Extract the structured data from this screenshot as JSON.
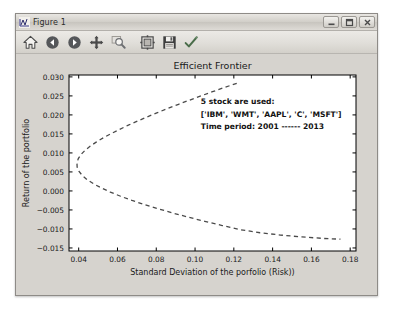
{
  "window": {
    "title": "Figure 1",
    "icon": "matplotlib-icon",
    "buttons": [
      {
        "name": "minimize-button",
        "glyph": "minimize"
      },
      {
        "name": "maximize-button",
        "glyph": "maximize"
      },
      {
        "name": "close-button",
        "glyph": "close"
      }
    ]
  },
  "toolbar": {
    "items": [
      {
        "name": "home-button",
        "icon": "home-icon",
        "tooltip": "Reset original view"
      },
      {
        "name": "back-button",
        "icon": "back-arrow-icon",
        "tooltip": "Back to previous view"
      },
      {
        "name": "forward-button",
        "icon": "forward-arrow-icon",
        "tooltip": "Forward to next view"
      },
      {
        "name": "pan-button",
        "icon": "pan-move-icon",
        "tooltip": "Pan axes with left mouse, zoom with right"
      },
      {
        "name": "zoom-button",
        "icon": "zoom-rect-icon",
        "tooltip": "Zoom to rectangle"
      },
      {
        "name": "configure-subplots-button",
        "icon": "subplot-config-icon",
        "tooltip": "Configure subplots"
      },
      {
        "name": "save-button",
        "icon": "floppy-save-icon",
        "tooltip": "Save the figure"
      },
      {
        "name": "edit-parameters-button",
        "icon": "edit-check-icon",
        "tooltip": "Edit axis, curve and image parameters"
      }
    ]
  },
  "chart_data": {
    "type": "line",
    "title": "Efficient Frontier",
    "xlabel": "Standard Deviation of the porfolio (Risk))",
    "ylabel": "Return of the portfolio",
    "xlim": [
      0.035,
      0.183
    ],
    "ylim": [
      -0.0158,
      0.0305
    ],
    "xticks": [
      "0.04",
      "0.06",
      "0.08",
      "0.10",
      "0.12",
      "0.14",
      "0.16",
      "0.18"
    ],
    "xtick_values": [
      0.04,
      0.06,
      0.08,
      0.1,
      0.12,
      0.14,
      0.16,
      0.18
    ],
    "yticks": [
      "0.030",
      "0.025",
      "0.020",
      "0.015",
      "0.010",
      "0.005",
      "0.000",
      "-0.005",
      "-0.010",
      "-0.015"
    ],
    "ytick_values": [
      0.03,
      0.025,
      0.02,
      0.015,
      0.01,
      0.005,
      0.0,
      -0.005,
      -0.01,
      -0.015
    ],
    "grid": false,
    "legend": "none",
    "line_style": "dashed",
    "line_color": "#4a4a4a",
    "series": [
      {
        "name": "efficient-frontier-curve",
        "comment": "sideways parabola; vertex at minimum-variance point",
        "x": [
          0.1215,
          0.115,
          0.109,
          0.103,
          0.0972,
          0.0915,
          0.086,
          0.0806,
          0.0754,
          0.0704,
          0.0656,
          0.0611,
          0.0568,
          0.0528,
          0.0492,
          0.046,
          0.0433,
          0.0412,
          0.0398,
          0.0391,
          0.0392,
          0.0401,
          0.0418,
          0.0443,
          0.0476,
          0.0516,
          0.0563,
          0.0616,
          0.0675,
          0.074,
          0.081,
          0.0885,
          0.0965,
          0.105,
          0.114,
          0.1235,
          0.1335,
          0.144,
          0.155,
          0.1663,
          0.175
        ],
        "y": [
          0.0283,
          0.0272,
          0.0261,
          0.025,
          0.0239,
          0.0228,
          0.0217,
          0.0206,
          0.0195,
          0.0184,
          0.0173,
          0.0162,
          0.0151,
          0.014,
          0.0129,
          0.0118,
          0.0107,
          0.0096,
          0.0085,
          0.0074,
          0.0063,
          0.0052,
          0.0041,
          0.003,
          0.0019,
          0.0008,
          -0.0003,
          -0.0014,
          -0.0025,
          -0.0036,
          -0.0047,
          -0.0058,
          -0.0069,
          -0.008,
          -0.0091,
          -0.0102,
          -0.011,
          -0.0116,
          -0.0121,
          -0.0125,
          -0.0127
        ]
      }
    ],
    "annotations": [
      {
        "name": "annotation-stock-count",
        "text": "5 stock are used:",
        "x": 0.103,
        "y": 0.0228
      },
      {
        "name": "annotation-ticker-list",
        "text": "['IBM', 'WMT', 'AAPL', 'C', 'MSFT']",
        "x": 0.103,
        "y": 0.0195
      },
      {
        "name": "annotation-time-period",
        "text": "Time period: 2001 ------ 2013",
        "x": 0.103,
        "y": 0.0162
      }
    ]
  }
}
